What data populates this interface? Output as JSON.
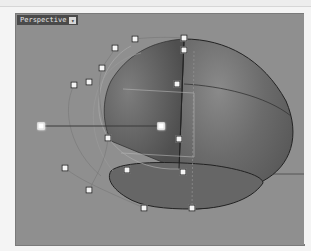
{
  "viewport": {
    "label": "Perspective",
    "dropdown_icon": "triangle-down-icon",
    "background_color": "#8f8f8f",
    "surface_color": "#6a6a6a"
  },
  "control_points": [
    {
      "x": 114,
      "y": 47
    },
    {
      "x": 134,
      "y": 38
    },
    {
      "x": 183,
      "y": 37
    },
    {
      "x": 183,
      "y": 49
    },
    {
      "x": 101,
      "y": 67
    },
    {
      "x": 88,
      "y": 81
    },
    {
      "x": 73,
      "y": 84
    },
    {
      "x": 176,
      "y": 83
    },
    {
      "x": 40,
      "y": 125,
      "highlight": true
    },
    {
      "x": 160,
      "y": 125,
      "highlight": true
    },
    {
      "x": 107,
      "y": 137
    },
    {
      "x": 178,
      "y": 138
    },
    {
      "x": 64,
      "y": 167
    },
    {
      "x": 126,
      "y": 169
    },
    {
      "x": 182,
      "y": 171
    },
    {
      "x": 88,
      "y": 189
    },
    {
      "x": 143,
      "y": 207
    },
    {
      "x": 191,
      "y": 207
    }
  ]
}
